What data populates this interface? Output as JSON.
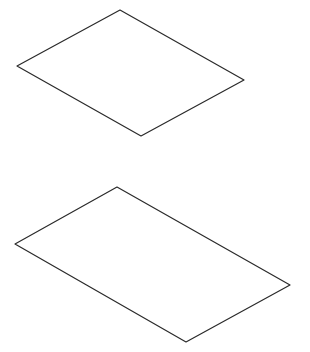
{
  "diagram": {
    "background": "#ffffff",
    "stroke_color": "#2a2a2a",
    "stroke_width": 1.2,
    "shapes": [
      {
        "name": "top-parallelogram",
        "points": "120,10 244,80 141,136 17,66"
      },
      {
        "name": "bottom-parallelogram",
        "points": "117,187 290,285 186,342 15,244"
      }
    ]
  }
}
